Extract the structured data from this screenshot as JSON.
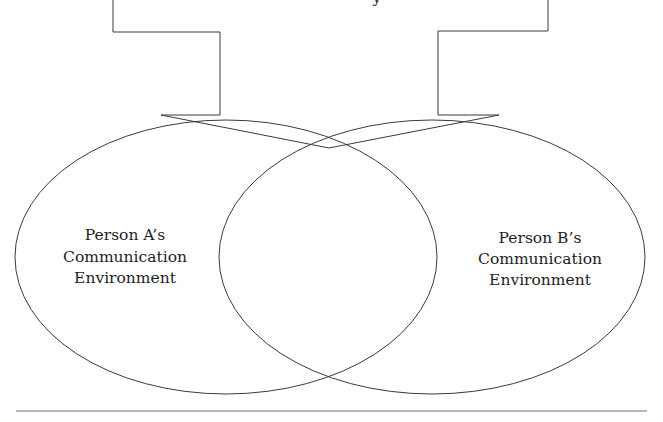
{
  "diagram": {
    "type": "overlapping-ellipses-with-arrow",
    "top_text_fragment": "y",
    "ellipses": [
      {
        "id": "person-a",
        "lines": [
          "Person A’s",
          "Communication",
          "Environment"
        ]
      },
      {
        "id": "person-b",
        "lines": [
          "Person B’s",
          "Communication",
          "Environment"
        ]
      }
    ],
    "colors": {
      "stroke": "#3a3a3a",
      "separator": "#a0a0a0",
      "text": "#1e1e1e",
      "background": "#ffffff"
    }
  }
}
